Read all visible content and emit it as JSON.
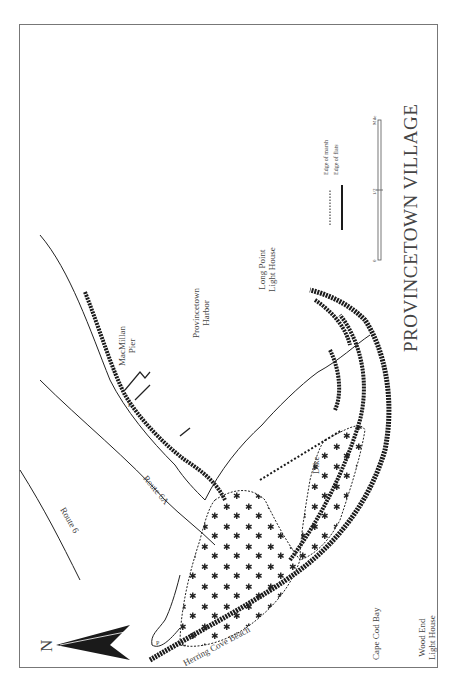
{
  "map": {
    "title": "PROVINCETOWN VILLAGE",
    "orientation": "rotated 90° counter-clockwise (north points left)",
    "north_label": "N",
    "legend": {
      "items": [
        {
          "symbol": "dotted-line",
          "label": "Edge of marsh"
        },
        {
          "symbol": "solid-rough-line",
          "label": "Edge of flats"
        }
      ]
    },
    "scale_bar": {
      "ticks": [
        "0",
        "1/2",
        "Mile"
      ]
    },
    "labels": {
      "macmillan_pier": [
        "MacMillan",
        "Pier"
      ],
      "provincetown_harbor": [
        "Provincetown",
        "Harbor"
      ],
      "long_point_light": [
        "Long Point",
        "Light House"
      ],
      "wood_end_light": [
        "Wood End",
        "Light House"
      ],
      "route_6a": "Route 6A",
      "route_6": "Route 6",
      "dike": "Dike",
      "herring_cove_beach": "Herring Cove Beach",
      "cape_cod_bay": "Cape Cod Bay",
      "parking_1": "P",
      "parking_2": "P"
    },
    "colors": {
      "ink": "#1a1a1a",
      "frame": "#777777",
      "text": "#444444",
      "background": "#ffffff"
    }
  }
}
